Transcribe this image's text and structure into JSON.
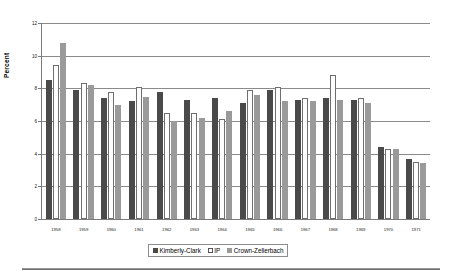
{
  "chart_data": {
    "type": "bar",
    "title": "",
    "xlabel": "",
    "ylabel": "Percent",
    "ylim": [
      0,
      12
    ],
    "yticks": [
      0,
      2,
      4,
      6,
      8,
      10,
      12
    ],
    "grid": true,
    "legend_position": "bottom",
    "categories": [
      "1958",
      "1959",
      "1960",
      "1961",
      "1962",
      "1963",
      "1964",
      "1965",
      "1966",
      "1967",
      "1968",
      "1969",
      "1970",
      "1971"
    ],
    "series": [
      {
        "name": "Kimberly-Clark",
        "color": "#4a4a4a",
        "values": [
          8.5,
          7.9,
          7.4,
          7.2,
          7.8,
          7.3,
          7.4,
          7.1,
          7.9,
          7.3,
          7.4,
          7.3,
          4.4,
          3.7
        ]
      },
      {
        "name": "IP",
        "color": "#fdfdfd",
        "values": [
          9.4,
          8.3,
          7.8,
          8.1,
          6.5,
          6.5,
          6.1,
          7.9,
          8.1,
          7.4,
          8.8,
          7.4,
          4.3,
          3.5
        ]
      },
      {
        "name": "Crown-Zellerbach",
        "color": "#9a9a9a",
        "values": [
          10.8,
          8.2,
          7.0,
          7.5,
          6.0,
          6.2,
          6.6,
          7.6,
          7.2,
          7.2,
          7.3,
          7.1,
          4.3,
          3.4
        ]
      }
    ]
  },
  "legend": {
    "items": [
      {
        "label": "Kimberly-Clark"
      },
      {
        "label": "IP"
      },
      {
        "label": "Crown-Zellerbach"
      }
    ]
  }
}
